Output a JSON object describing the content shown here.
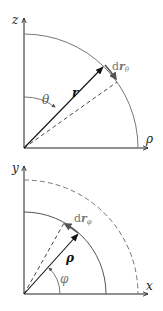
{
  "colors": {
    "axis": "#222222",
    "arc": "#666666",
    "vector": "#111111",
    "dashed": "#333333",
    "label_gray": "#777777",
    "background": "#ffffff"
  },
  "top_diagram": {
    "title": "spherical coordinates in z-rho plane",
    "vertical_axis_label": "z",
    "horizontal_axis_label": "ρ",
    "vector_label": "r",
    "angle_label": "θ",
    "differential_label_prefix": "d",
    "differential_label_vector": "r",
    "differential_label_sub": "θ"
  },
  "bottom_diagram": {
    "title": "polar coordinates in x-y plane",
    "vertical_axis_label": "y",
    "horizontal_axis_label": "x",
    "vector_label": "ρ",
    "angle_label": "φ",
    "differential_label_prefix": "d",
    "differential_label_vector": "r",
    "differential_label_sub": "φ"
  }
}
